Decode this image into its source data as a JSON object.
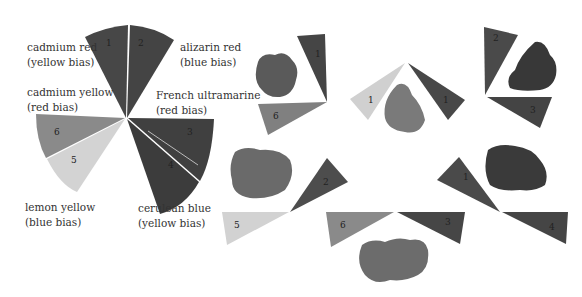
{
  "wheel": {
    "labels": [
      {
        "name": "cadmium red",
        "bias": "(yellow bias)"
      },
      {
        "name": "alizarin red",
        "bias": "(blue bias)"
      },
      {
        "name": "cadmium yellow",
        "bias": "(red bias)"
      },
      {
        "name": "French ultramarine",
        "bias": "(red bias)"
      },
      {
        "name": "lemon yellow",
        "bias": "(blue bias)"
      },
      {
        "name": "cerulean blue",
        "bias": "(yellow bias)"
      }
    ],
    "segment_numbers": [
      "1",
      "2",
      "3",
      "4",
      "5",
      "6"
    ]
  },
  "mixes": [
    {
      "id": "mix-red-yellow",
      "numbers": [
        "1",
        "6"
      ]
    },
    {
      "id": "mix-lemon-red",
      "numbers": [
        "1",
        "1"
      ]
    },
    {
      "id": "mix-alizarin-ultramarine",
      "numbers": [
        "2",
        "3"
      ]
    },
    {
      "id": "mix-lemon-alizarin",
      "numbers": [
        "5",
        "2"
      ]
    },
    {
      "id": "mix-yellow-blue",
      "numbers": [
        "6",
        "3"
      ]
    },
    {
      "id": "mix-cadred-cerulean",
      "numbers": [
        "1",
        "4"
      ]
    }
  ],
  "colors": {
    "dark": "#4a4a4a",
    "darker": "#3e3e3e",
    "mid": "#7a7a7a",
    "light": "#cfcfcf",
    "yellow6": "#8f8f8f"
  }
}
